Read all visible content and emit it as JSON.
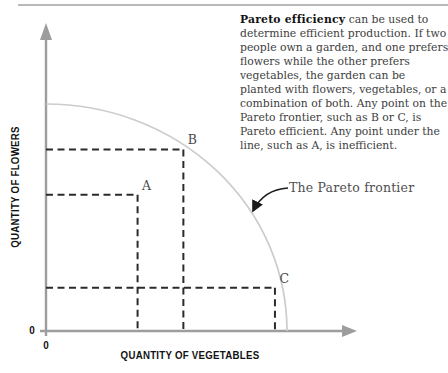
{
  "article": {
    "lead": "Pareto efficiency",
    "body": " can be used to determine efficient production. If two people own a garden, and one prefers flowers while the other prefers vegetables, the garden can be planted with flowers, vegetables, or a combination of both. Any point on the Pareto frontier, such as B or C, is Pareto efficient. Any point under the line, such as A, is inefficient."
  },
  "chart_data": {
    "type": "line",
    "title": "",
    "xlabel": "QUANTITY OF VEGETABLES",
    "ylabel": "QUANTITY OF FLOWERS",
    "x_origin_label": "0",
    "y_origin_label": "0",
    "axis_range_x": [
      0,
      1
    ],
    "axis_range_y": [
      0,
      1
    ],
    "grid": false,
    "frontier": {
      "shape": "concave quarter-ellipse production possibility frontier",
      "y_intercept": 1.0,
      "x_intercept": 1.0
    },
    "annotation": {
      "label": "The Pareto frontier"
    },
    "points": [
      {
        "label": "A",
        "x": 0.38,
        "y": 0.6,
        "pareto_efficient": false
      },
      {
        "label": "B",
        "x": 0.57,
        "y": 0.8,
        "pareto_efficient": true
      },
      {
        "label": "C",
        "x": 0.95,
        "y": 0.19,
        "pareto_efficient": true
      }
    ],
    "colors": {
      "axis": "#9d9d9d",
      "frontier": "#cccccc",
      "dashed_lines": "#2b2b2b",
      "annotation_arrow": "#1c1c1c"
    }
  }
}
